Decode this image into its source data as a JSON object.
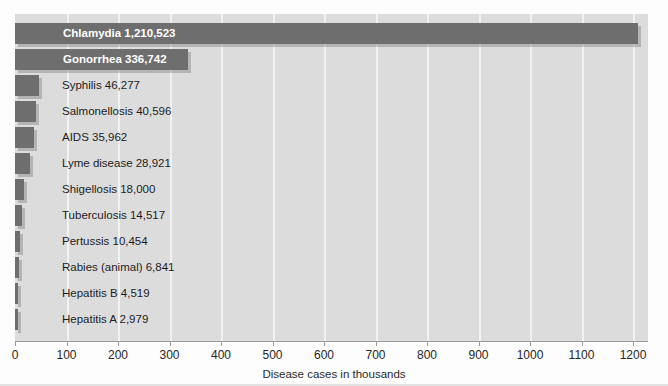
{
  "chart_data": {
    "type": "bar",
    "orientation": "horizontal",
    "title": "",
    "xlabel": "Disease cases in thousands",
    "ylabel": "",
    "xlim": [
      0,
      1229
    ],
    "xticks": [
      0,
      100,
      200,
      300,
      400,
      500,
      600,
      700,
      800,
      900,
      1000,
      1100,
      1200
    ],
    "xtick_labels": [
      "0",
      "100",
      "200",
      "300",
      "400",
      "500",
      "600",
      "700",
      "800",
      "900",
      "1000",
      "1100",
      "1200"
    ],
    "grid": "vertical-white",
    "legend": "none",
    "units": "thousands of cases",
    "categories": [
      "Chlamydia",
      "Gonorrhea",
      "Syphilis",
      "Salmonellosis",
      "AIDS",
      "Lyme disease",
      "Shigellosis",
      "Tuberculosis",
      "Pertussis",
      "Rabies (animal)",
      "Hepatitis B",
      "Hepatitis A"
    ],
    "values": [
      1210523,
      336742,
      46277,
      40596,
      35962,
      28921,
      18000,
      14517,
      10454,
      6841,
      4519,
      2979
    ],
    "value_labels": [
      "1,210,523",
      "336,742",
      "46,277",
      "40,596",
      "35,962",
      "28,921",
      "18,000",
      "14,517",
      "10,454",
      "6,841",
      "4,519",
      "2,979"
    ],
    "data_labels": [
      "Chlamydia  1,210,523",
      "Gonorrhea  336,742",
      "Syphilis  46,277",
      "Salmonellosis  40,596",
      "AIDS  35,962",
      "Lyme disease  28,921",
      "Shigellosis 18,000",
      "Tuberculosis  14,517",
      "Pertussis 10,454",
      "Rabies (animal)  6,841",
      "Hepatitis B  4,519",
      "Hepatitis A  2,979"
    ],
    "label_placement": [
      "inside",
      "inside",
      "outside",
      "outside",
      "outside",
      "outside",
      "outside",
      "outside",
      "outside",
      "outside",
      "outside",
      "outside"
    ],
    "colors": {
      "bar": "#6e6e6e",
      "plot_background": "#dcdcdc",
      "gridline": "#f2f2f2",
      "page_background": "#fdfdfd",
      "inside_label_text": "#ffffff",
      "outside_label_text": "#1c1c1c",
      "axis_line": "#9a9a9a",
      "bar_shadow": "#828282"
    }
  }
}
